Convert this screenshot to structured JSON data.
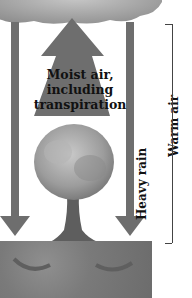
{
  "diagram": {
    "type": "water-cycle-transpiration",
    "labels": {
      "moist_air_line1": "Moist air,",
      "moist_air_line2": "including",
      "moist_air_line3": "transpiration",
      "heavy_rain": "Heavy rain",
      "warm_air": "Warm air"
    },
    "elements": [
      "cloud",
      "upward-arrow",
      "tree",
      "left-rain-arrow",
      "right-rain-arrow",
      "soil",
      "warm-air-bracket"
    ],
    "colors": {
      "arrow": "#6e6e6e",
      "cloud": "#9a9a9a",
      "soil": "#777777",
      "tree_foliage": "#a0a0a0",
      "text": "#111111",
      "bracket": "#444444"
    }
  }
}
